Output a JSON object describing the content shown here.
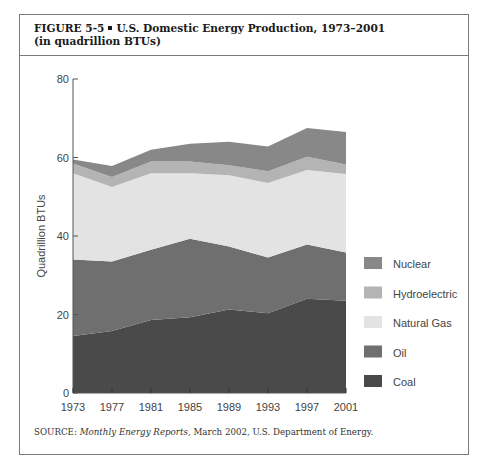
{
  "figure": {
    "label": "FIGURE 5-5",
    "title_line1": "U.S. Domestic Energy Production, 1973–2001",
    "title_line2": "(in quadrillion BTUs)",
    "source_prefix": "SOURCE: ",
    "source_italic": "Monthly Energy Reports,",
    "source_rest": " March 2002, U.S. Department of Energy."
  },
  "chart_data": {
    "type": "area",
    "stacked": true,
    "title": "U.S. Domestic Energy Production, 1973–2001 (in quadrillion BTUs)",
    "xlabel": "",
    "ylabel": "Quadrillion BTUs",
    "x": [
      1973,
      1977,
      1981,
      1985,
      1989,
      1993,
      1997,
      2001
    ],
    "xticks": [
      "1973",
      "1977",
      "1981",
      "1985",
      "1989",
      "1993",
      "1997",
      "2001"
    ],
    "ylim": [
      0,
      80
    ],
    "yticks": [
      "0",
      "20",
      "40",
      "60",
      "80"
    ],
    "grid": false,
    "legend_position": "right",
    "series": [
      {
        "name": "Coal",
        "color": "#4a4a4a",
        "values": [
          14.5,
          15.8,
          18.6,
          19.3,
          21.3,
          20.3,
          24.0,
          23.5
        ]
      },
      {
        "name": "Oil",
        "color": "#6f6f6f",
        "values": [
          19.5,
          17.7,
          17.9,
          20.0,
          16.0,
          14.2,
          13.8,
          12.3
        ]
      },
      {
        "name": "Natural Gas",
        "color": "#e3e3e3",
        "values": [
          22.0,
          19.0,
          19.5,
          16.7,
          18.2,
          19.0,
          19.0,
          20.0
        ]
      },
      {
        "name": "Hydroelectric",
        "color": "#b4b4b4",
        "values": [
          2.5,
          2.5,
          3.0,
          3.0,
          2.5,
          3.0,
          3.4,
          2.4
        ]
      },
      {
        "name": "Nuclear",
        "color": "#888888",
        "values": [
          1.0,
          2.8,
          3.0,
          4.5,
          6.0,
          6.3,
          7.3,
          8.3
        ]
      }
    ],
    "legend_order": [
      "Nuclear",
      "Hydroelectric",
      "Natural Gas",
      "Oil",
      "Coal"
    ]
  }
}
